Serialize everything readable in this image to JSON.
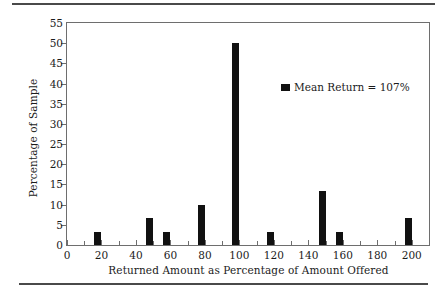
{
  "chart_data": {
    "type": "bar",
    "title": "",
    "subtitle": "",
    "xlabel": "Returned Amount as Percentage of Amount Offered",
    "ylabel": "Percentage of Sample",
    "xlim": [
      0,
      210
    ],
    "ylim": [
      0,
      55
    ],
    "grid": false,
    "xticks": [
      0,
      20,
      40,
      60,
      80,
      100,
      120,
      140,
      160,
      180,
      200
    ],
    "yticks": [
      0,
      5,
      10,
      15,
      20,
      25,
      30,
      35,
      40,
      45,
      50,
      55
    ],
    "categories": [
      20,
      50,
      60,
      80,
      100,
      120,
      150,
      160,
      200
    ],
    "values": [
      3.3,
      6.7,
      3.3,
      10,
      50,
      3.3,
      13.3,
      3.3,
      6.7
    ],
    "bar_color": "#111111",
    "bar_width": 7,
    "legend": {
      "position": "inside-upper-right",
      "entries": [
        {
          "label": "Mean Return = 107%",
          "color": "#111111",
          "marker": "square"
        }
      ]
    },
    "annotations": []
  },
  "figure": {
    "rules": {
      "top": "horizontal-rule",
      "bottom": "horizontal-rule"
    },
    "axis_color": "#6e6e6e",
    "text_color": "#1b1b1b",
    "background": "#ffffff"
  }
}
